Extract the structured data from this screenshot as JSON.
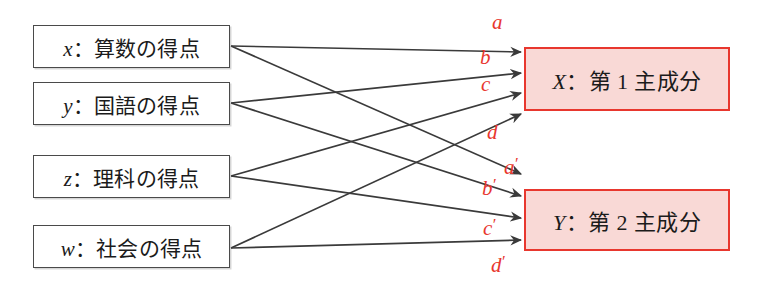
{
  "diagram": {
    "title_text": "",
    "colors": {
      "accent_red": "#e8372e",
      "pc_fill": "#f9d9d6",
      "box_border": "#4a4a4a",
      "edge": "#3a3a3a"
    },
    "inputs": [
      {
        "id": "x",
        "var": "x",
        "sep": "：",
        "text": "算数の得点",
        "box": {
          "x": 33,
          "y": 25,
          "w": 197,
          "h": 43
        },
        "anchor": {
          "x": 231,
          "y": 46
        }
      },
      {
        "id": "y",
        "var": "y",
        "sep": "：",
        "text": "国語の得点",
        "box": {
          "x": 33,
          "y": 82,
          "w": 197,
          "h": 43
        },
        "anchor": {
          "x": 231,
          "y": 103
        }
      },
      {
        "id": "z",
        "var": "z",
        "sep": "：",
        "text": "理科の得点",
        "box": {
          "x": 33,
          "y": 155,
          "w": 197,
          "h": 43
        },
        "anchor": {
          "x": 231,
          "y": 176
        }
      },
      {
        "id": "w",
        "var": "w",
        "sep": "：",
        "text": "社会の得点",
        "box": {
          "x": 33,
          "y": 225,
          "w": 197,
          "h": 43
        },
        "anchor": {
          "x": 231,
          "y": 248
        }
      }
    ],
    "components": [
      {
        "id": "X",
        "var": "X",
        "sep": "：",
        "text": "第 1 主成分",
        "box": {
          "x": 524,
          "y": 47,
          "w": 206,
          "h": 64
        }
      },
      {
        "id": "Y",
        "var": "Y",
        "sep": "：",
        "text": "第 2 主成分",
        "box": {
          "x": 524,
          "y": 189,
          "w": 206,
          "h": 62
        }
      }
    ],
    "edges": [
      {
        "id": "edge-x-X",
        "from": "x",
        "to": "X",
        "label": "a",
        "prime": "",
        "label_pos": {
          "x": 492,
          "y": 12
        },
        "tip": {
          "x": 521,
          "y": 52
        }
      },
      {
        "id": "edge-y-X",
        "from": "y",
        "to": "X",
        "label": "b",
        "prime": "",
        "label_pos": {
          "x": 480,
          "y": 47
        },
        "tip": {
          "x": 521,
          "y": 73
        }
      },
      {
        "id": "edge-z-X",
        "from": "z",
        "to": "X",
        "label": "c",
        "prime": "",
        "label_pos": {
          "x": 481,
          "y": 74
        },
        "tip": {
          "x": 521,
          "y": 93
        }
      },
      {
        "id": "edge-w-X",
        "from": "w",
        "to": "X",
        "label": "d",
        "prime": "",
        "label_pos": {
          "x": 487,
          "y": 122
        },
        "tip": {
          "x": 521,
          "y": 114
        }
      },
      {
        "id": "edge-x-Y",
        "from": "x",
        "to": "Y",
        "label": "a",
        "prime": "′",
        "label_pos": {
          "x": 504,
          "y": 155
        },
        "tip": {
          "x": 521,
          "y": 174
        }
      },
      {
        "id": "edge-y-Y",
        "from": "y",
        "to": "Y",
        "label": "b",
        "prime": "′",
        "label_pos": {
          "x": 482,
          "y": 176
        },
        "tip": {
          "x": 521,
          "y": 196
        }
      },
      {
        "id": "edge-z-Y",
        "from": "z",
        "to": "Y",
        "label": "c",
        "prime": "′",
        "label_pos": {
          "x": 483,
          "y": 216
        },
        "tip": {
          "x": 521,
          "y": 218
        }
      },
      {
        "id": "edge-w-Y",
        "from": "w",
        "to": "Y",
        "label": "d",
        "prime": "′",
        "label_pos": {
          "x": 491,
          "y": 253
        },
        "tip": {
          "x": 521,
          "y": 240
        }
      }
    ]
  }
}
